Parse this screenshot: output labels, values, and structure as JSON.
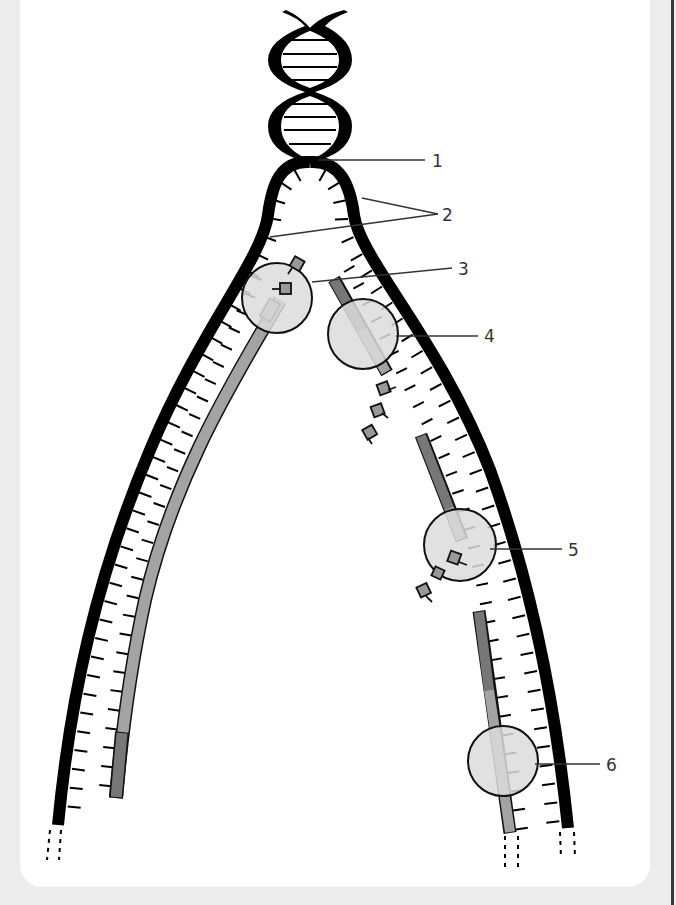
{
  "diagram": {
    "labels": [
      {
        "id": "1",
        "text": "1",
        "x": 432,
        "y": 167
      },
      {
        "id": "2",
        "text": "2",
        "x": 442,
        "y": 221
      },
      {
        "id": "3",
        "text": "3",
        "x": 458,
        "y": 275
      },
      {
        "id": "4",
        "text": "4",
        "x": 484,
        "y": 342
      },
      {
        "id": "5",
        "text": "5",
        "x": 568,
        "y": 556
      },
      {
        "id": "6",
        "text": "6",
        "x": 606,
        "y": 771
      }
    ],
    "leaders": [
      {
        "label": "1",
        "x1": 318,
        "y1": 160,
        "x2": 425,
        "y2": 160
      },
      {
        "label": "2",
        "x1": 362,
        "y1": 198,
        "x2": 438,
        "y2": 214
      },
      {
        "label": "2",
        "x1": 270,
        "y1": 237,
        "x2": 438,
        "y2": 214
      },
      {
        "label": "3",
        "x1": 312,
        "y1": 282,
        "x2": 452,
        "y2": 268
      },
      {
        "label": "4",
        "x1": 396,
        "y1": 336,
        "x2": 478,
        "y2": 336
      },
      {
        "label": "5",
        "x1": 490,
        "y1": 549,
        "x2": 562,
        "y2": 549
      },
      {
        "label": "6",
        "x1": 535,
        "y1": 764,
        "x2": 600,
        "y2": 764
      }
    ],
    "colors": {
      "strand": "#000000",
      "enzyme_fill": "#dcdcdc",
      "new_strand_dark": "#777777",
      "new_strand_light": "#a3a3a3",
      "leader": "#333333"
    },
    "enzymes": [
      {
        "name": "enzyme-circle-left-top",
        "cx": 277,
        "cy": 298,
        "r": 35
      },
      {
        "name": "enzyme-circle-4",
        "cx": 363,
        "cy": 334,
        "r": 35
      },
      {
        "name": "enzyme-circle-5",
        "cx": 460,
        "cy": 545,
        "r": 36
      },
      {
        "name": "enzyme-circle-6",
        "cx": 503,
        "cy": 761,
        "r": 35
      }
    ]
  }
}
